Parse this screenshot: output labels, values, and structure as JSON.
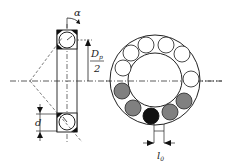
{
  "diagram": {
    "labels": {
      "alpha": "α",
      "dp_num": "D",
      "dp_sub": "p",
      "dp_den": "2",
      "d": "d",
      "l0": "l",
      "l0_sub": "0"
    },
    "colors": {
      "line": "#222222",
      "ball_loaded": "#808080",
      "ball_max": "#111111",
      "ball_free": "#ffffff"
    },
    "ring": {
      "balls_total": 12,
      "loaded_gray": 4,
      "loaded_black": 1
    }
  }
}
